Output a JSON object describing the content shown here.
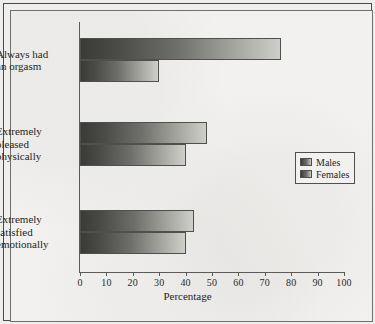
{
  "chart_data": {
    "type": "bar",
    "orientation": "horizontal",
    "title": "",
    "xlabel": "Percentage",
    "ylabel": "",
    "xlim": [
      0,
      100
    ],
    "xticks": [
      0,
      10,
      20,
      30,
      40,
      50,
      60,
      70,
      80,
      90,
      100
    ],
    "grid": false,
    "legend_position": "right",
    "categories": [
      "Always had an orgasm",
      "Extremely pleased physically",
      "Extremely satisfied emotionally"
    ],
    "category_lines": [
      [
        "Always had",
        "an orgasm"
      ],
      [
        "Extremely",
        "pleased",
        "physically"
      ],
      [
        "Extremely",
        "satisfied",
        "emotionally"
      ]
    ],
    "series": [
      {
        "name": "Males",
        "values": [
          76,
          48,
          43
        ]
      },
      {
        "name": "Females",
        "values": [
          30,
          40,
          40
        ]
      }
    ]
  },
  "legend": {
    "items": [
      {
        "label": "Males"
      },
      {
        "label": "Females"
      }
    ]
  },
  "axis": {
    "x_title": "Percentage",
    "tick_labels": [
      "0",
      "10",
      "20",
      "30",
      "40",
      "50",
      "60",
      "70",
      "80",
      "90",
      "100"
    ]
  },
  "colors": {
    "bar_gradient_start": "#3a3a38",
    "bar_gradient_end": "#cfcfc9",
    "bar_border": "#4f4f4c",
    "axis": "#5a5a57",
    "text": "#1f1f1d",
    "paper": "#f2f1ef",
    "frame": "#4a4a48"
  }
}
